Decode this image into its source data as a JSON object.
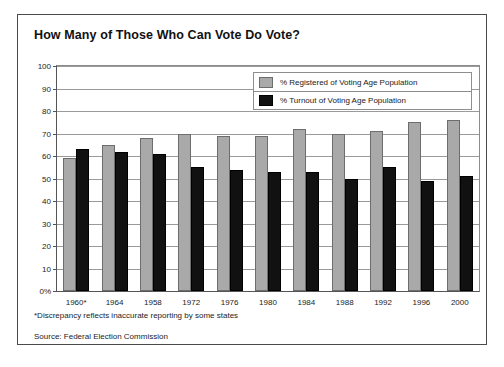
{
  "chart_data": {
    "type": "bar",
    "title": "How Many of Those Who Can Vote Do Vote?",
    "xlabel": "",
    "ylabel": "",
    "ylim": [
      0,
      100
    ],
    "yticks": [
      "0%",
      "10",
      "20",
      "30",
      "40",
      "50",
      "60",
      "70",
      "80",
      "90",
      "100"
    ],
    "grid": true,
    "legend_position": "top-right",
    "categories": [
      "1960*",
      "1964",
      "1958",
      "1972",
      "1976",
      "1980",
      "1984",
      "1988",
      "1992",
      "1996",
      "2000"
    ],
    "series": [
      {
        "name": "% Registered of Voting Age Population",
        "color": "#a9a9a9",
        "values": [
          59,
          65,
          68,
          70,
          69,
          69,
          72,
          70,
          71,
          75,
          76
        ]
      },
      {
        "name": "% Turnout of Voting Age Population",
        "color": "#111111",
        "values": [
          63,
          62,
          61,
          55,
          54,
          53,
          53,
          50,
          55,
          49,
          51
        ]
      }
    ],
    "annotations": [
      "*Discrepancy reflects inaccurate reporting by some states",
      "Source: Federal Election Commission"
    ]
  },
  "legend": {
    "items": [
      {
        "label": "% Registered of Voting Age Population",
        "swatch": "registered"
      },
      {
        "label": "% Turnout of Voting Age Population",
        "swatch": "turnout"
      }
    ]
  },
  "footnotes": {
    "discrepancy": "*Discrepancy reflects inaccurate reporting by some states",
    "source": "Source: Federal Election Commission"
  },
  "colors": {
    "registered": "#a9a9a9",
    "turnout": "#111111",
    "frame": "#4a4a4a",
    "grid": "#9a9a9a"
  }
}
